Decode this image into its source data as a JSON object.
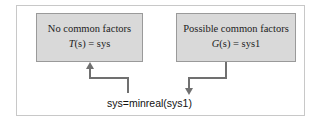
{
  "left_box": {
    "title": "No common factors",
    "eq_func": "T",
    "eq_arg": "(s)",
    "eq_rhs": " = sys"
  },
  "right_box": {
    "title": "Possible common factors",
    "eq_func": "G",
    "eq_arg": "(s)",
    "eq_rhs": " = sys1"
  },
  "command": "sys=minreal(sys1)",
  "colors": {
    "box_fill": "#d9d9d9",
    "arrow": "#707070",
    "border": "#c8c8c8"
  }
}
